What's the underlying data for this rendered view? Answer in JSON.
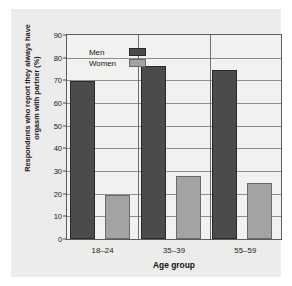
{
  "chart_data": {
    "type": "bar",
    "title": "",
    "xlabel": "Age group",
    "ylabel": "Respondents who report they always have orgasm with partner (%)",
    "categories": [
      "18–24",
      "35–39",
      "55–59"
    ],
    "series": [
      {
        "name": "Men",
        "values": [
          69.5,
          76.5,
          74.5
        ],
        "color": "#4b4b4b"
      },
      {
        "name": "Women",
        "values": [
          19.5,
          28,
          24.5
        ],
        "color": "#a3a3a3"
      }
    ],
    "ylim": [
      0,
      90
    ],
    "yticks": [
      0,
      10,
      20,
      30,
      40,
      50,
      60,
      70,
      80,
      90
    ],
    "ytick_labels": [
      "0",
      "10",
      "20",
      "30",
      "40",
      "50",
      "60",
      "70",
      "80",
      "90"
    ],
    "grid": true,
    "legend_position": "top-left"
  },
  "legend": {
    "entries": [
      {
        "label": "Men",
        "color": "#4b4b4b"
      },
      {
        "label": "Women",
        "color": "#a3a3a3"
      }
    ]
  },
  "colors": {
    "background": "#ececea",
    "plot_background": "#f1f1ef",
    "axis": "#5d5d5d",
    "grid": "#8e8e8e",
    "men": "#4b4b4b",
    "women": "#a3a3a3"
  }
}
